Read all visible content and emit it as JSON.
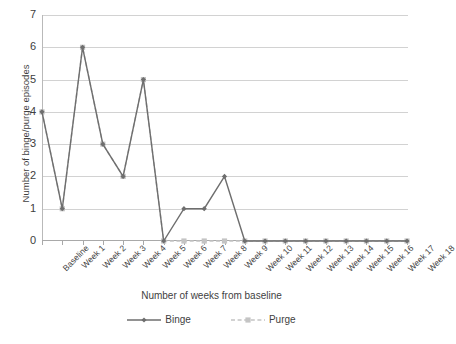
{
  "chart_data": {
    "type": "line",
    "title": "",
    "xlabel": "Number of weeks from baseline",
    "ylabel": "Number of binge/purge episodes",
    "categories": [
      "Baseline",
      "Week 1",
      "Week 2",
      "Week 3",
      "Week 4",
      "Week 5",
      "Week 6",
      "Week 7",
      "Week 8",
      "Week 9",
      "Week 10",
      "Week 11",
      "Week 12",
      "Week 13",
      "Week 14",
      "Week 15",
      "Week 16",
      "Week 17",
      "Week 18"
    ],
    "series": [
      {
        "name": "Binge",
        "values": [
          4,
          1,
          6,
          3,
          2,
          5,
          0,
          1,
          1,
          2,
          0,
          0,
          0,
          0,
          0,
          0,
          0,
          0,
          0
        ],
        "color": "#6e6e6e",
        "line_style": "solid",
        "marker": "diamond"
      },
      {
        "name": "Purge",
        "values": [
          4,
          1,
          6,
          3,
          2,
          5,
          0,
          0,
          0,
          0,
          0,
          0,
          0,
          0,
          0,
          0,
          0,
          0,
          0
        ],
        "color": "#c4c4c4",
        "line_style": "dashed",
        "marker": "square"
      }
    ],
    "ylim": [
      0,
      7
    ],
    "y_ticks": [
      0,
      1,
      2,
      3,
      4,
      5,
      6,
      7
    ],
    "grid": true,
    "legend_position": "bottom"
  },
  "axes": {
    "y_tick_labels": [
      "0",
      "1",
      "2",
      "3",
      "4",
      "5",
      "6",
      "7"
    ],
    "y_title": "Number of binge/purge episodes",
    "x_title": "Number of weeks from baseline"
  },
  "legend": {
    "entries": [
      {
        "label": "Binge"
      },
      {
        "label": "Purge"
      }
    ]
  }
}
